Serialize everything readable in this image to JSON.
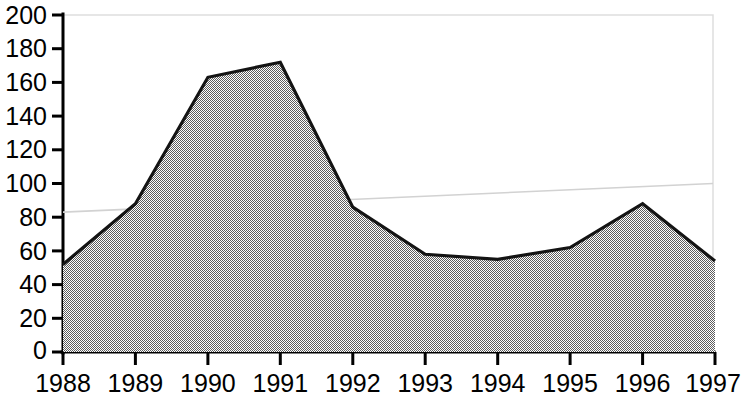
{
  "chart_data": {
    "type": "area",
    "title": "",
    "subtitle": "",
    "xlabel": "",
    "ylabel": "",
    "categories": [
      "1988",
      "1989",
      "1990",
      "1991",
      "1992",
      "1993",
      "1994",
      "1995",
      "1996",
      "1997"
    ],
    "series": [
      {
        "name": "series-1",
        "values": [
          52,
          88,
          163,
          172,
          86,
          58,
          55,
          62,
          88,
          54
        ]
      },
      {
        "name": "trend-line",
        "values": [
          83,
          85,
          87,
          89,
          91,
          93,
          94,
          96,
          98,
          100
        ]
      }
    ],
    "ylim": [
      0,
      200
    ],
    "yticks": [
      0,
      20,
      40,
      60,
      80,
      100,
      120,
      140,
      160,
      180,
      200
    ],
    "ytick_labels": [
      "0",
      "20",
      "40",
      "60",
      "80",
      "100",
      "120",
      "140",
      "160",
      "180",
      "200"
    ],
    "xtick_labels": [
      "1988",
      "1989",
      "1990",
      "1991",
      "1992",
      "1993",
      "1994",
      "1995",
      "1996",
      "1997"
    ],
    "grid": false,
    "legend": "none",
    "colors": {
      "area_fill": "#999999",
      "area_outline": "#141414",
      "axis": "#000000",
      "trend": "#d2d2d2",
      "plot_border": "#dedede",
      "background": "#ffffff",
      "tick_text": "#000000"
    }
  }
}
